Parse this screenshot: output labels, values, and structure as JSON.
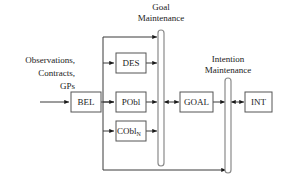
{
  "figure": {
    "type": "block-diagram",
    "background_color": "#ffffff",
    "box_stroke_color": "#555555",
    "bar_stroke_color": "#8a8a8a",
    "edge_color": "#3a3a3a",
    "text_color": "#1a1a1a"
  },
  "inputs": {
    "lines": [
      "Observations,",
      "Contracts,",
      "GPs"
    ]
  },
  "nodes": {
    "bel": {
      "label": "BEL"
    },
    "des": {
      "label": "DES"
    },
    "pobl": {
      "label": "PObl"
    },
    "cobl": {
      "label": "CObl",
      "subscript": "N"
    },
    "goal": {
      "label": "GOAL"
    },
    "int": {
      "label": "INT"
    }
  },
  "bars": {
    "goal_maintenance": {
      "label_line1": "Goal",
      "label_line2": "Maintenance"
    },
    "intention_maintenance": {
      "label_line1": "Intention",
      "label_line2": "Maintenance"
    }
  }
}
